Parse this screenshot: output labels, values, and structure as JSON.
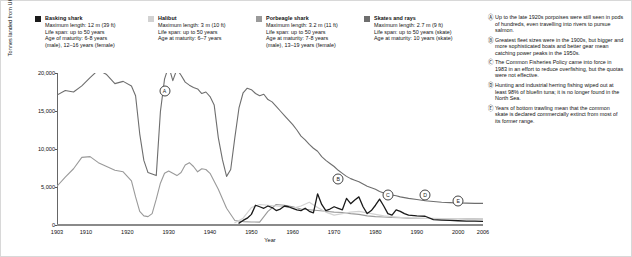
{
  "legend": [
    {
      "name": "Basking shark",
      "color": "#1a1a1a",
      "lines": [
        "Maximum length: 12 m (39 ft)",
        "Life span: up to 50 years",
        "Age of maturity: 6-8 years",
        "(male), 12–16 years (female)"
      ]
    },
    {
      "name": "Halibut",
      "color": "#d2d2d2",
      "lines": [
        "Maximum length: 3 m (10 ft)",
        "Life span: up to 50 years",
        "Age at maturity: 6–7 years"
      ]
    },
    {
      "name": "Porbeagle shark",
      "color": "#9a9a9a",
      "lines": [
        "Maximum length: 3.2 m (11 ft)",
        "Life span: up to 50 years",
        "Age at maturity: 7-8 years",
        "(male), 13–19 years (female)"
      ]
    },
    {
      "name": "Skates and rays",
      "color": "#6e6e6e",
      "lines": [
        "Maximum length: 2.7 m (9 ft)",
        "Life span: up to 50 years (skate)",
        "Age at maturity: 10 years (skate)"
      ]
    }
  ],
  "notes": [
    {
      "mark": "Ⓐ",
      "text": "Up to the late 1920s porpoises were still seen in pods of hundreds, even travelling into rivers to pursue salmon."
    },
    {
      "mark": "Ⓑ",
      "text": "Greatest fleet sizes were in the 1900s, but bigger and more sophisticated boats and better gear mean catching power peaks in the 1950s."
    },
    {
      "mark": "Ⓒ",
      "text": "The Common Fisheries Policy came into force in 1983 in an effort to reduce overfishing, but the quotas were not effective."
    },
    {
      "mark": "Ⓓ",
      "text": "Hunting and industrial herring fishing wiped out at least 98% of bluefin tuna; it is no longer found in the North Sea."
    },
    {
      "mark": "Ⓔ",
      "text": "Years of bottom trawling mean that the common skate is declared commercially extinct from most of its former range."
    }
  ],
  "chart_data": {
    "type": "line",
    "title": "",
    "xlabel": "Year",
    "ylabel": "Tonnes landed from UK waters",
    "xlim": [
      1903,
      2006
    ],
    "ylim": [
      0,
      20000
    ],
    "yticks": [
      0,
      5000,
      10000,
      15000,
      20000
    ],
    "ytick_labels": [
      "0",
      "5,000",
      "10,000",
      "15,000",
      "20,000"
    ],
    "xticks": [
      1903,
      1910,
      1920,
      1930,
      1940,
      1950,
      1960,
      1970,
      1980,
      1990,
      2000,
      2006
    ],
    "xtick_labels": [
      "1903",
      "1910",
      "1920",
      "1930",
      "1940",
      "1950",
      "1960",
      "1970",
      "1980",
      "1990",
      "2000",
      "2006"
    ],
    "grid": false,
    "legend_position": "top",
    "annotations": [
      {
        "label": "A",
        "x": 1929,
        "y": 17600
      },
      {
        "label": "B",
        "x": 1971,
        "y": 6100
      },
      {
        "label": "C",
        "x": 1983,
        "y": 3900
      },
      {
        "label": "D",
        "x": 1992,
        "y": 3900
      },
      {
        "label": "E",
        "x": 2000,
        "y": 3100
      }
    ],
    "series": [
      {
        "name": "Skates and rays",
        "color": "#6e6e6e",
        "width": 1.1,
        "x": [
          1903,
          1905,
          1907,
          1909,
          1911,
          1913,
          1915,
          1917,
          1919,
          1921,
          1922,
          1923,
          1924,
          1925,
          1926,
          1927,
          1928,
          1929,
          1930,
          1931,
          1932,
          1933,
          1934,
          1935,
          1936,
          1937,
          1938,
          1939,
          1940,
          1941,
          1942,
          1943,
          1944,
          1945,
          1946,
          1947,
          1948,
          1949,
          1950,
          1951,
          1952,
          1953,
          1954,
          1955,
          1956,
          1957,
          1958,
          1959,
          1960,
          1961,
          1962,
          1963,
          1964,
          1965,
          1966,
          1967,
          1968,
          1969,
          1970,
          1971,
          1972,
          1973,
          1974,
          1975,
          1976,
          1977,
          1978,
          1979,
          1980,
          1981,
          1982,
          1983,
          1984,
          1985,
          1986,
          1988,
          1990,
          1992,
          1994,
          1996,
          1998,
          2000,
          2002,
          2004,
          2006
        ],
        "values": [
          17100,
          17700,
          17500,
          18300,
          19400,
          20400,
          19800,
          18600,
          18900,
          18300,
          17000,
          12000,
          8500,
          6900,
          6700,
          6500,
          14900,
          19200,
          20900,
          19000,
          20500,
          19700,
          18800,
          18400,
          18100,
          17900,
          17300,
          17500,
          16900,
          15800,
          11500,
          8600,
          6400,
          7300,
          11500,
          15400,
          17400,
          18000,
          17800,
          17300,
          17000,
          17200,
          16500,
          16200,
          15600,
          15000,
          14400,
          13800,
          13200,
          12500,
          11700,
          11200,
          10600,
          10100,
          9700,
          9000,
          8500,
          8100,
          7700,
          7200,
          6800,
          6400,
          6100,
          5900,
          5700,
          5400,
          5100,
          4900,
          4700,
          4400,
          4200,
          4100,
          3950,
          3850,
          3700,
          3500,
          3350,
          3200,
          3100,
          3000,
          2950,
          2900,
          2880,
          2850,
          2840
        ]
      },
      {
        "name": "Porbeagle shark",
        "color": "#9a9a9a",
        "width": 1.1,
        "x": [
          1903,
          1905,
          1907,
          1909,
          1911,
          1913,
          1915,
          1917,
          1919,
          1921,
          1922,
          1923,
          1924,
          1925,
          1926,
          1927,
          1928,
          1929,
          1930,
          1931,
          1932,
          1933,
          1934,
          1935,
          1936,
          1937,
          1938,
          1939,
          1940,
          1942,
          1944,
          1946,
          1948,
          1950,
          1952,
          1954,
          1956,
          1958,
          1960,
          1962,
          1964,
          1966,
          1968,
          1970,
          1972,
          1974,
          1976,
          1978,
          1980,
          1982,
          1984,
          1986,
          1988,
          1990,
          1992,
          1994,
          1996,
          1998,
          2000,
          2002,
          2004,
          2006
        ],
        "values": [
          5100,
          6300,
          7400,
          8900,
          9000,
          8200,
          7700,
          7200,
          7000,
          5800,
          3700,
          1800,
          1200,
          1100,
          1500,
          3400,
          5500,
          6800,
          7100,
          6800,
          6500,
          6900,
          7900,
          8200,
          7700,
          7000,
          7400,
          7300,
          6800,
          4700,
          2200,
          600,
          450,
          400,
          380,
          1800,
          2700,
          2600,
          2400,
          2100,
          2000,
          1900,
          1800,
          1700,
          1650,
          1500,
          1400,
          1200,
          1100,
          1050,
          980,
          950,
          900,
          880,
          860,
          850,
          840,
          830,
          820,
          810,
          800,
          790
        ]
      },
      {
        "name": "Halibut",
        "color": "#d2d2d2",
        "width": 1.2,
        "x": [
          1946,
          1948,
          1950,
          1952,
          1954,
          1956,
          1958,
          1960,
          1962,
          1964,
          1966,
          1968,
          1970,
          1972,
          1974,
          1976,
          1978,
          1980,
          1982,
          1984,
          1986,
          1988,
          1990,
          1992,
          1994,
          1996,
          1998,
          2000,
          2002,
          2004,
          2006
        ],
        "values": [
          300,
          900,
          2300,
          2700,
          2600,
          2500,
          2400,
          2200,
          2500,
          3000,
          2300,
          1700,
          1300,
          1500,
          1700,
          1800,
          1600,
          1400,
          1200,
          1100,
          1000,
          950,
          900,
          880,
          860,
          850,
          840,
          830,
          820,
          810,
          800
        ]
      },
      {
        "name": "Basking shark",
        "color": "#1a1a1a",
        "width": 1.3,
        "x": [
          1947,
          1948,
          1949,
          1950,
          1951,
          1952,
          1953,
          1954,
          1955,
          1956,
          1957,
          1958,
          1959,
          1960,
          1961,
          1962,
          1963,
          1964,
          1965,
          1966,
          1967,
          1968,
          1969,
          1970,
          1971,
          1972,
          1973,
          1974,
          1975,
          1976,
          1977,
          1978,
          1979,
          1980,
          1981,
          1982,
          1983,
          1984,
          1985,
          1986,
          1987,
          1988,
          1990,
          1992,
          1994,
          1996,
          1998,
          2000,
          2002,
          2004,
          2006
        ],
        "values": [
          250,
          600,
          900,
          1400,
          2600,
          2400,
          2200,
          2500,
          2300,
          1900,
          2100,
          2500,
          2400,
          2200,
          2000,
          1900,
          2200,
          1800,
          1600,
          4100,
          2700,
          1900,
          2100,
          2400,
          2200,
          2000,
          3500,
          2800,
          3300,
          3700,
          2400,
          1500,
          1900,
          2600,
          3400,
          2500,
          1500,
          1300,
          2000,
          1800,
          1500,
          1300,
          1200,
          1150,
          700,
          650,
          600,
          560,
          520,
          500,
          480
        ]
      }
    ]
  }
}
